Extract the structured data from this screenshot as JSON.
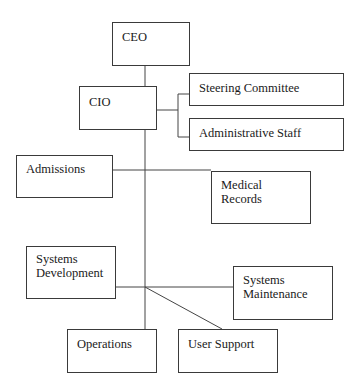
{
  "diagram": {
    "type": "organization-chart",
    "nodes": {
      "ceo": "CEO",
      "cio": "CIO",
      "steering_committee": "Steering Committee",
      "administrative_staff": "Administrative Staff",
      "admissions": "Admissions",
      "medical_records": "Medical\nRecords",
      "systems_development": "Systems\nDevelopment",
      "systems_maintenance": "Systems\nMaintenance",
      "operations": "Operations",
      "user_support": "User Support"
    },
    "edges": [
      [
        "CEO",
        "CIO"
      ],
      [
        "CIO",
        "Steering Committee"
      ],
      [
        "CIO",
        "Administrative Staff"
      ],
      [
        "CIO",
        "Admissions"
      ],
      [
        "CIO",
        "Medical Records"
      ],
      [
        "CIO",
        "Systems Development"
      ],
      [
        "CIO",
        "Systems Maintenance"
      ],
      [
        "CIO",
        "Operations"
      ],
      [
        "CIO",
        "User Support"
      ]
    ]
  }
}
